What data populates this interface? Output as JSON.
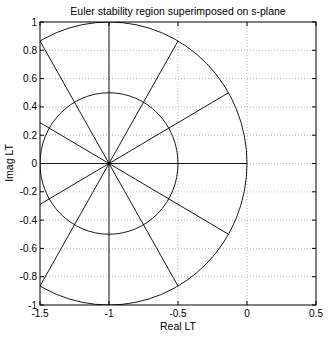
{
  "chart_data": {
    "type": "line",
    "title": "Euler stability region superimposed on s-plane",
    "xlabel": "Real LT",
    "ylabel": "Imag LT",
    "xlim": [
      -1.5,
      0.5
    ],
    "ylim": [
      -1,
      1
    ],
    "xticks": [
      -1.5,
      -1,
      -0.5,
      0,
      0.5
    ],
    "xtick_labels": [
      "-1.5",
      "-1",
      "-0.5",
      "0",
      "0.5"
    ],
    "yticks": [
      -1,
      -0.8,
      -0.6,
      -0.4,
      -0.2,
      0,
      0.2,
      0.4,
      0.6,
      0.8,
      1
    ],
    "ytick_labels": [
      "-1",
      "-0.8",
      "-0.6",
      "-0.4",
      "-0.2",
      "0",
      "0.2",
      "0.4",
      "0.6",
      "0.8",
      "1"
    ],
    "grid": true,
    "grid_style": "dotted",
    "legend": null,
    "series": [
      {
        "name": "outer circle (Euler stability boundary)",
        "shape": "circle",
        "center": [
          -1,
          0
        ],
        "radius": 1
      },
      {
        "name": "inner circle",
        "shape": "circle",
        "center": [
          -1,
          0
        ],
        "radius": 0.5
      },
      {
        "name": "radial lines",
        "shape": "rays",
        "origin": [
          -1,
          0
        ],
        "angles_deg": [
          0,
          30,
          60,
          90,
          120,
          150,
          180,
          210,
          240,
          270,
          300,
          330
        ],
        "length": 1
      }
    ],
    "line_color": "#000000"
  },
  "figure": {
    "title": "Euler stability region superimposed on s-plane",
    "xlabel": "Real LT",
    "ylabel": "Imag LT"
  }
}
